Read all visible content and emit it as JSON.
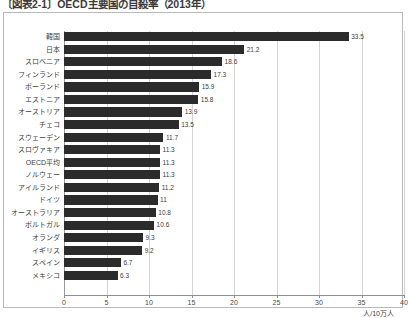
{
  "title": "〔図表2-1〕OECD主要国の自殺率（2013年）",
  "unit_label": "人/10万人",
  "colors": {
    "bar": "#2b2b2b",
    "gridline": "#d4d4d4",
    "axis": "#8f8f8f",
    "border": "#b9b9b9",
    "background": "#ffffff",
    "text": "#3d3d3d"
  },
  "chart_data": {
    "type": "bar",
    "orientation": "horizontal",
    "title": "〔図表2-1〕OECD主要国の自殺率（2013年）",
    "xlabel": "人/10万人",
    "ylabel": "",
    "xlim": [
      0,
      40
    ],
    "xticks": [
      0,
      5,
      10,
      15,
      20,
      25,
      30,
      35,
      40
    ],
    "grid": true,
    "legend": null,
    "categories": [
      "韓国",
      "日本",
      "スロベニア",
      "フィンランド",
      "ポーランド",
      "エストニア",
      "オーストリア",
      "チェコ",
      "スウェーデン",
      "スロヴァキア",
      "OECD平均",
      "ノルウェー",
      "アイルランド",
      "ドイツ",
      "オーストラリア",
      "ポルトガル",
      "オランダ",
      "イギリス",
      "スペイン",
      "メキシコ"
    ],
    "values": [
      33.5,
      21.2,
      18.6,
      17.3,
      15.9,
      15.8,
      13.9,
      13.5,
      11.7,
      11.3,
      11.3,
      11.3,
      11.2,
      11,
      10.8,
      10.6,
      9.3,
      9.2,
      6.7,
      6.3
    ],
    "value_labels": [
      "33.5",
      "21.2",
      "18.6",
      "17.3",
      "15.9",
      "15.8",
      "13.9",
      "13.5",
      "11.7",
      "11.3",
      "11.3",
      "11.3",
      "11.2",
      "11",
      "10.8",
      "10.6",
      "9.3",
      "9.2",
      "6.7",
      "6.3"
    ]
  }
}
